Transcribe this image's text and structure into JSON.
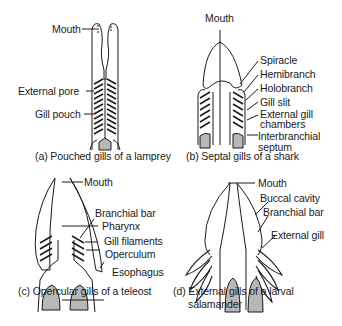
{
  "panels": {
    "a": {
      "caption": "(a) Pouched gills of a lamprey",
      "labels": [
        "Mouth",
        "External pore",
        "Gill pouch"
      ]
    },
    "b": {
      "caption": "(b) Septal gills of a shark",
      "labels": [
        "Mouth",
        "Spiracle",
        "Hemibranch",
        "Holobranch",
        "Gill slit",
        "External gill",
        "chambers",
        "Interbranchial",
        "septum"
      ]
    },
    "c": {
      "caption": "(c) Opercular gills of a teleost",
      "labels": [
        "Mouth",
        "Branchial bar",
        "Pharynx",
        "Gill filaments",
        "Operculum",
        "Esophagus"
      ]
    },
    "d": {
      "caption_line1": "(d) External gills of a larval",
      "caption_line2": "salamander",
      "labels": [
        "Mouth",
        "Buccal cavity",
        "Branchial bar",
        "External gill"
      ]
    }
  },
  "colors": {
    "ink": "#1a1a1a",
    "fill_gray": "#b8b8b8"
  }
}
